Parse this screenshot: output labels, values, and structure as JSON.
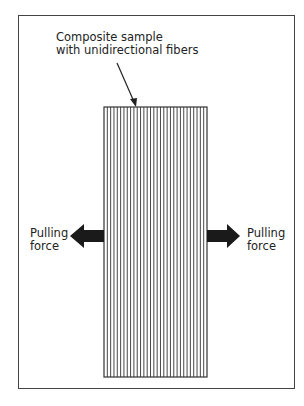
{
  "diagram": {
    "sample_label": [
      "Composite sample",
      "with unidirectional fibers"
    ],
    "left_force_label": [
      "Pulling",
      "force"
    ],
    "right_force_label": [
      "Pulling",
      "force"
    ],
    "sample": {
      "fiber_count": 31,
      "fiber_orientation": "vertical"
    },
    "colors": {
      "line": "#333333",
      "arrow": "#1a1a1a",
      "background": "#ffffff"
    }
  }
}
